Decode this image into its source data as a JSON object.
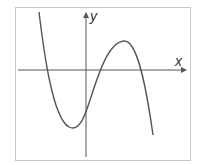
{
  "diagram": {
    "type": "function-graph",
    "axes": {
      "x_label": "x",
      "y_label": "y"
    },
    "colors": {
      "border": "#c8c8c8",
      "axis": "#555555",
      "curve": "#555555",
      "label": "#333333",
      "background": "#ffffff"
    },
    "curve_features": {
      "leading_coefficient_sign": "negative",
      "roots_count": 3,
      "roots_signs": [
        "negative",
        "positive",
        "positive"
      ],
      "y_intercept_sign": "negative",
      "local_minimum": "x < 0, y < 0",
      "local_maximum": "x > 0, y > 0"
    }
  }
}
